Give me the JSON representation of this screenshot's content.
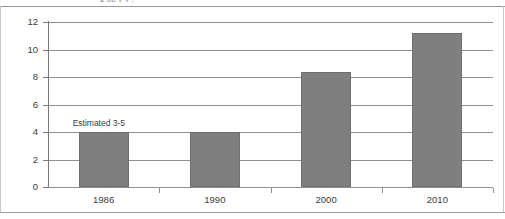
{
  "page": {
    "clipped_header_fragment": "g  pp                                 y     y ,"
  },
  "chart_data": {
    "type": "bar",
    "title": "",
    "subtitle": "",
    "xlabel": "",
    "ylabel": "",
    "categories": [
      "1986",
      "1990",
      "2000",
      "2010"
    ],
    "values": [
      4,
      4,
      8.4,
      11.2
    ],
    "series": [
      {
        "name": "",
        "values": [
          4,
          4,
          8.4,
          11.2
        ]
      }
    ],
    "ylim": [
      0,
      12
    ],
    "ytick_labels": [
      "0",
      "2",
      "4",
      "6",
      "8",
      "10",
      "12"
    ],
    "ytick_values": [
      0,
      2,
      4,
      6,
      8,
      10,
      12
    ],
    "grid": true,
    "legend": "none",
    "bar_color": "#7f7f7f",
    "annotations": [
      {
        "text": "Estimated 3-5",
        "category": "1986",
        "value": 4.6
      }
    ]
  }
}
